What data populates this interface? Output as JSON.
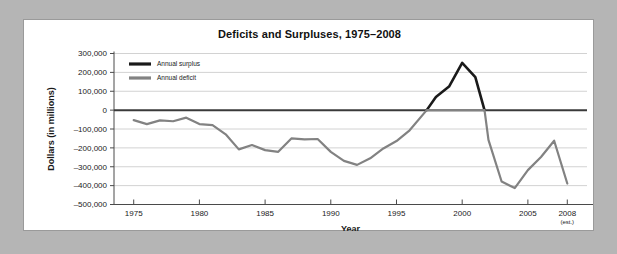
{
  "figure": {
    "title": "Deficits and Surpluses, 1975–2008",
    "background_color": "#b5b5b5",
    "card_color": "#ffffff",
    "border_color": "#9a9a9a"
  },
  "chart_data": {
    "type": "line",
    "title": "Deficits and Surpluses, 1975–2008",
    "subtitle": "",
    "xlabel": "Year",
    "ylabel": "Dollars (in millions)",
    "xlim": [
      1973.5,
      2009.5
    ],
    "ylim": [
      -500000,
      300000
    ],
    "grid": true,
    "grid_axis": "y",
    "legend_position": "top-left",
    "zero_line": 0,
    "x_ticks": [
      1975,
      1980,
      1985,
      1990,
      1995,
      2000,
      2005,
      2008
    ],
    "x_tick_labels": [
      "1975",
      "1980",
      "1985",
      "1990",
      "1995",
      "2000",
      "2005",
      "2008"
    ],
    "x_tick_sublabels": [
      "",
      "",
      "",
      "",
      "",
      "",
      "",
      "(est.)"
    ],
    "y_ticks": [
      300000,
      200000,
      100000,
      0,
      -100000,
      -200000,
      -300000,
      -400000,
      -500000
    ],
    "y_tick_labels": [
      "300,000",
      "200,000",
      "100,000",
      "0",
      "–100,000",
      "–200,000",
      "–300,000",
      "–400,000",
      "–500,000"
    ],
    "series": [
      {
        "name": "Annual surplus",
        "color": "#1a1a1a",
        "x": [
          1997.3,
          1998,
          1999,
          2000,
          2001,
          2001.7
        ],
        "values": [
          0,
          70000,
          125000,
          250000,
          175000,
          0
        ]
      },
      {
        "name": "Annual deficit",
        "color": "#828282",
        "x": [
          1975,
          1976,
          1977,
          1978,
          1979,
          1980,
          1981,
          1982,
          1983,
          1984,
          1985,
          1986,
          1987,
          1988,
          1989,
          1990,
          1991,
          1992,
          1993,
          1994,
          1995,
          1996,
          1997.3,
          2001.7,
          2002,
          2003,
          2004,
          2005,
          2006,
          2007,
          2008
        ],
        "values": [
          -53000,
          -74000,
          -54000,
          -59000,
          -40000,
          -74000,
          -79000,
          -128000,
          -208000,
          -185000,
          -212000,
          -221000,
          -150000,
          -155000,
          -153000,
          -221000,
          -269000,
          -290000,
          -255000,
          -203000,
          -164000,
          -107000,
          0,
          0,
          -158000,
          -378000,
          -413000,
          -318000,
          -248000,
          -162000,
          -389000
        ]
      }
    ],
    "legend": [
      {
        "label": "Annual surplus",
        "color": "#1a1a1a"
      },
      {
        "label": "Annual deficit",
        "color": "#828282"
      }
    ]
  }
}
